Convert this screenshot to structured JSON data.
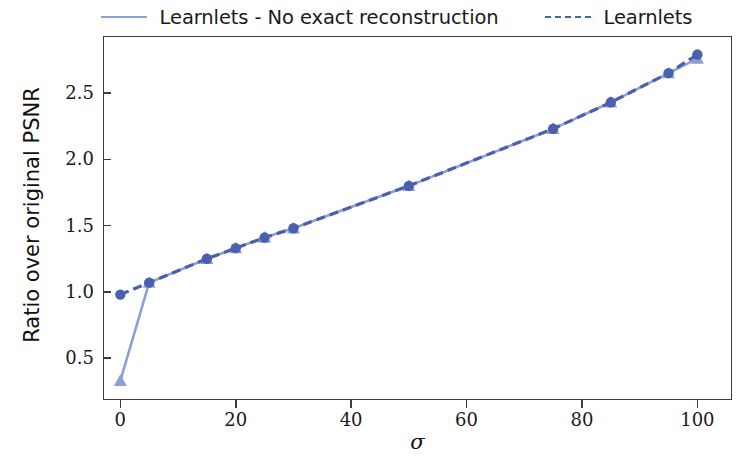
{
  "chart_data": {
    "type": "line",
    "title": "",
    "xlabel": "σ",
    "ylabel": "Ratio over original PSNR",
    "xlim": [
      -3,
      106
    ],
    "ylim": [
      0.185,
      2.93
    ],
    "xticks": [
      0,
      20,
      40,
      60,
      80,
      100
    ],
    "xticklabels": [
      "0",
      "20",
      "40",
      "60",
      "80",
      "100"
    ],
    "yticks": [
      0.5,
      1.0,
      1.5,
      2.0,
      2.5
    ],
    "yticklabels": [
      "0.5",
      "1.0",
      "1.5",
      "2.0",
      "2.5"
    ],
    "grid": false,
    "legend_position": "above-top-center",
    "series": [
      {
        "name": "Learnlets - No exact reconstruction",
        "color": "#8e9fd6",
        "linestyle": "solid",
        "marker": "triangle",
        "x": [
          0,
          5,
          15,
          20,
          25,
          30,
          50,
          75,
          85,
          95,
          100
        ],
        "y": [
          0.33,
          1.07,
          1.25,
          1.33,
          1.41,
          1.48,
          1.8,
          2.23,
          2.43,
          2.65,
          2.76
        ]
      },
      {
        "name": "Learnlets",
        "color": "#4b5faf",
        "linestyle": "dashed",
        "marker": "circle",
        "x": [
          0,
          5,
          15,
          20,
          25,
          30,
          50,
          75,
          85,
          95,
          100
        ],
        "y": [
          0.98,
          1.07,
          1.25,
          1.33,
          1.41,
          1.48,
          1.8,
          2.23,
          2.43,
          2.65,
          2.79
        ]
      }
    ]
  },
  "legend": {
    "entries": [
      {
        "label": "Learnlets - No exact reconstruction"
      },
      {
        "label": "Learnlets"
      }
    ]
  },
  "axes": {
    "xlabel": "σ",
    "ylabel": "Ratio over original PSNR"
  }
}
